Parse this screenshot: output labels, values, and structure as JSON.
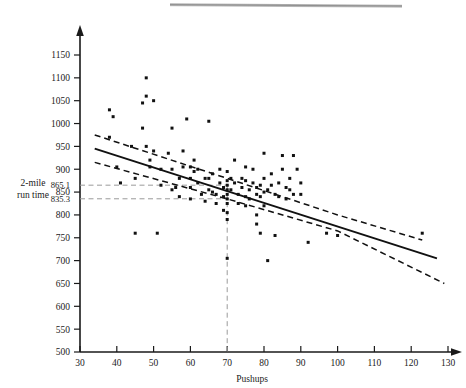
{
  "chart_data": {
    "type": "scatter",
    "title": "",
    "xlabel": "Pushups",
    "ylabel": "2-mile run time",
    "ylabel_lines": [
      "2-mile",
      "run time"
    ],
    "xlim": [
      30,
      132
    ],
    "ylim": [
      500,
      1175
    ],
    "xticks": [
      30,
      40,
      50,
      60,
      70,
      80,
      90,
      100,
      110,
      120,
      130
    ],
    "yticks": [
      500,
      550,
      600,
      650,
      700,
      750,
      800,
      850,
      900,
      950,
      1000,
      1050,
      1100,
      1150
    ],
    "grid": false,
    "legend": null,
    "extra_ytick_labels": [
      "865.1",
      "835.3"
    ],
    "annotations": [
      {
        "name": "upper-prediction-label",
        "value": 865.1,
        "text": "865.1"
      },
      {
        "name": "lower-prediction-label",
        "value": 835.3,
        "text": "835.3"
      },
      {
        "name": "reference-pushups",
        "value": 70
      }
    ],
    "reference_lines": {
      "horizontal": [
        865.1,
        835.3
      ],
      "vertical": [
        70
      ],
      "style": "dashed-gray"
    },
    "regression_line": {
      "name": "fitted-regression-line",
      "style": "solid",
      "x": [
        34,
        127
      ],
      "y": [
        945,
        705
      ]
    },
    "confidence_bands": [
      {
        "name": "upper-confidence-band",
        "style": "dashed",
        "x": [
          34,
          70,
          100,
          123
        ],
        "y": [
          975,
          880,
          800,
          745
        ]
      },
      {
        "name": "lower-confidence-band",
        "style": "dashed",
        "x": [
          34,
          70,
          100,
          129
        ],
        "y": [
          915,
          835,
          765,
          650
        ]
      }
    ],
    "points": [
      [
        38,
        1030
      ],
      [
        38,
        970
      ],
      [
        39,
        1015
      ],
      [
        40,
        905
      ],
      [
        41,
        870
      ],
      [
        44,
        950
      ],
      [
        45,
        880
      ],
      [
        45,
        760
      ],
      [
        47,
        1045
      ],
      [
        47,
        990
      ],
      [
        48,
        1100
      ],
      [
        48,
        1060
      ],
      [
        48,
        950
      ],
      [
        49,
        920
      ],
      [
        49,
        905
      ],
      [
        50,
        1050
      ],
      [
        50,
        940
      ],
      [
        51,
        760
      ],
      [
        52,
        900
      ],
      [
        52,
        865
      ],
      [
        54,
        935
      ],
      [
        55,
        990
      ],
      [
        55,
        900
      ],
      [
        55,
        855
      ],
      [
        56,
        860
      ],
      [
        57,
        880
      ],
      [
        57,
        840
      ],
      [
        58,
        940
      ],
      [
        58,
        905
      ],
      [
        59,
        1010
      ],
      [
        60,
        905
      ],
      [
        60,
        880
      ],
      [
        60,
        860
      ],
      [
        60,
        835
      ],
      [
        61,
        920
      ],
      [
        61,
        895
      ],
      [
        62,
        900
      ],
      [
        62,
        870
      ],
      [
        63,
        845
      ],
      [
        64,
        880
      ],
      [
        64,
        830
      ],
      [
        65,
        1005
      ],
      [
        65,
        880
      ],
      [
        65,
        855
      ],
      [
        66,
        890
      ],
      [
        66,
        850
      ],
      [
        67,
        845
      ],
      [
        67,
        825
      ],
      [
        68,
        900
      ],
      [
        68,
        870
      ],
      [
        69,
        860
      ],
      [
        69,
        840
      ],
      [
        69,
        810
      ],
      [
        70,
        895
      ],
      [
        70,
        875
      ],
      [
        70,
        865
      ],
      [
        70,
        855
      ],
      [
        70,
        845
      ],
      [
        70,
        835
      ],
      [
        70,
        825
      ],
      [
        70,
        805
      ],
      [
        70,
        790
      ],
      [
        70,
        705
      ],
      [
        71,
        880
      ],
      [
        71,
        855
      ],
      [
        72,
        920
      ],
      [
        72,
        870
      ],
      [
        73,
        845
      ],
      [
        73,
        825
      ],
      [
        74,
        880
      ],
      [
        74,
        860
      ],
      [
        75,
        905
      ],
      [
        75,
        875
      ],
      [
        75,
        840
      ],
      [
        75,
        820
      ],
      [
        76,
        855
      ],
      [
        76,
        835
      ],
      [
        77,
        900
      ],
      [
        77,
        870
      ],
      [
        78,
        860
      ],
      [
        78,
        845
      ],
      [
        78,
        800
      ],
      [
        78,
        780
      ],
      [
        79,
        865
      ],
      [
        79,
        840
      ],
      [
        79,
        760
      ],
      [
        80,
        935
      ],
      [
        80,
        880
      ],
      [
        80,
        850
      ],
      [
        80,
        820
      ],
      [
        81,
        855
      ],
      [
        81,
        700
      ],
      [
        82,
        890
      ],
      [
        82,
        865
      ],
      [
        83,
        845
      ],
      [
        83,
        755
      ],
      [
        84,
        870
      ],
      [
        84,
        840
      ],
      [
        85,
        930
      ],
      [
        85,
        900
      ],
      [
        86,
        860
      ],
      [
        86,
        835
      ],
      [
        87,
        880
      ],
      [
        87,
        855
      ],
      [
        88,
        930
      ],
      [
        88,
        845
      ],
      [
        89,
        900
      ],
      [
        90,
        870
      ],
      [
        90,
        845
      ],
      [
        92,
        740
      ],
      [
        97,
        760
      ],
      [
        100,
        755
      ],
      [
        123,
        760
      ]
    ]
  }
}
